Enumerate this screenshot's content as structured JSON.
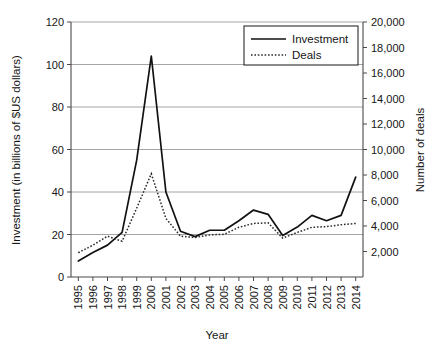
{
  "chart_data": {
    "type": "line",
    "title": "",
    "xlabel": "Year",
    "ylabel": "Investment (in billions of $US dollars)",
    "y2label": "Number of deals",
    "categories": [
      "1995",
      "1996",
      "1997",
      "1998",
      "1999",
      "2000",
      "2001",
      "2002",
      "2003",
      "2004",
      "2005",
      "2006",
      "2007",
      "2008",
      "2009",
      "2010",
      "2011",
      "2012",
      "2013",
      "2014"
    ],
    "ylim": [
      0,
      120
    ],
    "y2lim": [
      0,
      20000
    ],
    "yticks": [
      "0",
      "20",
      "40",
      "60",
      "80",
      "100",
      "120"
    ],
    "y2ticks": [
      "2,000",
      "4,000",
      "6,000",
      "8,000",
      "10,000",
      "12,000",
      "14,000",
      "16,000",
      "18,000",
      "20,000"
    ],
    "grid": true,
    "legend_position": "top-right",
    "series": [
      {
        "name": "Investment",
        "axis": "left",
        "style": "solid",
        "values": [
          7.5,
          11.5,
          15.0,
          21.0,
          55.0,
          104.0,
          40.0,
          21.5,
          19.0,
          22.0,
          22.0,
          26.5,
          31.5,
          29.5,
          19.5,
          23.5,
          29.0,
          26.5,
          29.0,
          47.0
        ]
      },
      {
        "name": "Deals",
        "axis": "right",
        "style": "dotted",
        "values": [
          1900,
          2500,
          3200,
          2800,
          5400,
          8100,
          4600,
          3200,
          3100,
          3300,
          3350,
          3900,
          4200,
          4250,
          3050,
          3500,
          3900,
          3950,
          4100,
          4200
        ]
      }
    ],
    "legend": [
      {
        "label": "Investment",
        "style": "solid"
      },
      {
        "label": "Deals",
        "style": "dotted"
      }
    ]
  }
}
